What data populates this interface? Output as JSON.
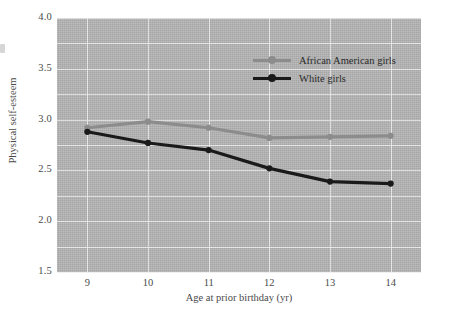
{
  "chart_data": {
    "type": "line",
    "title": "",
    "xlabel": "Age at prior birthday (yr)",
    "ylabel": "Physical self-esteem",
    "categories": [
      9,
      10,
      11,
      12,
      13,
      14
    ],
    "x": [
      9,
      10,
      11,
      12,
      13,
      14
    ],
    "xlim": [
      8.5,
      14.5
    ],
    "ylim": [
      1.5,
      4.0
    ],
    "yticks": [
      "1.5",
      "2.0",
      "2.5",
      "3.0",
      "3.5",
      "4.0"
    ],
    "ytick_values": [
      1.5,
      2.0,
      2.5,
      3.0,
      3.5,
      4.0
    ],
    "xticks": [
      "9",
      "10",
      "11",
      "12",
      "13",
      "14"
    ],
    "grid": true,
    "grid_color": "#efefef",
    "plot_background": "#b6b6b6",
    "legend_position": "upper right inside",
    "series": [
      {
        "name": "African American girls",
        "color": "#8c8c8c",
        "marker": "circle",
        "values": [
          2.92,
          2.98,
          2.92,
          2.82,
          2.83,
          2.84
        ]
      },
      {
        "name": "White girls",
        "color": "#1a1a1a",
        "marker": "circle",
        "values": [
          2.88,
          2.77,
          2.7,
          2.52,
          2.39,
          2.37
        ]
      }
    ]
  },
  "legend": {
    "items": [
      {
        "label": "African American girls",
        "color": "#8c8c8c"
      },
      {
        "label": "White girls",
        "color": "#1a1a1a"
      }
    ]
  }
}
